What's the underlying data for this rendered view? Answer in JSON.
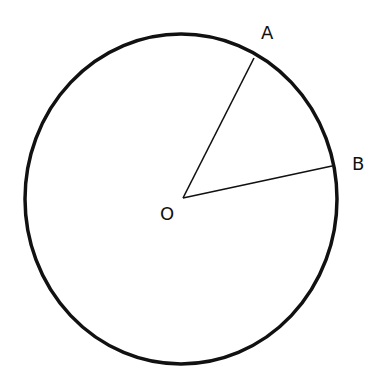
{
  "diagram": {
    "type": "circle-sector",
    "colors": {
      "stroke": "#111111",
      "background": "#ffffff"
    },
    "circle": {
      "cx": 181,
      "cy": 199,
      "rx": 156,
      "ry": 165,
      "stroke_width": 3.5
    },
    "center": {
      "label": "O",
      "x": 183,
      "y": 198
    },
    "points": [
      {
        "label": "A",
        "x": 254,
        "y": 58
      },
      {
        "label": "B",
        "x": 332,
        "y": 166
      }
    ],
    "segments": [
      "OA",
      "OB"
    ]
  },
  "labels": {
    "a": "A",
    "b": "B",
    "o": "O"
  }
}
